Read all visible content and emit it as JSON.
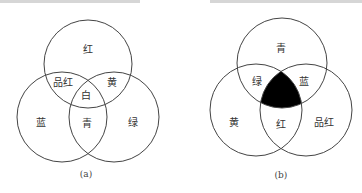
{
  "diagram_a": {
    "caption": "(a)",
    "title": "加色混合",
    "circles": [
      {
        "name": "red",
        "cx": 88,
        "cy": 64,
        "r": 44
      },
      {
        "name": "blue",
        "cx": 62,
        "cy": 117,
        "r": 45
      },
      {
        "name": "green",
        "cx": 114,
        "cy": 117,
        "r": 45
      }
    ],
    "labels": {
      "red": "红",
      "magenta": "品红",
      "yellow": "黄",
      "white": "白",
      "blue": "蓝",
      "cyan": "青",
      "green": "绿"
    }
  },
  "diagram_b": {
    "caption": "(b)",
    "title": "减色混合",
    "circles": [
      {
        "name": "cyan",
        "cx": 282,
        "cy": 63,
        "r": 45
      },
      {
        "name": "yellow",
        "cx": 256,
        "cy": 110,
        "r": 46
      },
      {
        "name": "magenta",
        "cx": 306,
        "cy": 110,
        "r": 46
      }
    ],
    "center_fill": "#000000",
    "labels": {
      "cyan": "青",
      "green": "绿",
      "blue": "蓝",
      "yellow": "黄",
      "red": "红",
      "magenta": "品红"
    }
  }
}
